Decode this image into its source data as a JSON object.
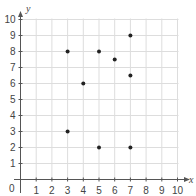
{
  "chart_data": {
    "type": "scatter",
    "title": "",
    "xlabel": "x",
    "ylabel": "y",
    "xlim": [
      0,
      10
    ],
    "ylim": [
      0,
      10
    ],
    "grid": true,
    "legend": null,
    "x_ticks": [
      "1",
      "2",
      "3",
      "4",
      "5",
      "6",
      "7",
      "8",
      "9",
      "10"
    ],
    "y_ticks": [
      "1",
      "2",
      "3",
      "4",
      "5",
      "6",
      "7",
      "8",
      "9",
      "10"
    ],
    "origin_label": "0",
    "points": [
      {
        "x": 3,
        "y": 8
      },
      {
        "x": 5,
        "y": 8
      },
      {
        "x": 7,
        "y": 9
      },
      {
        "x": 6,
        "y": 7.5
      },
      {
        "x": 4,
        "y": 6
      },
      {
        "x": 7,
        "y": 6.5
      },
      {
        "x": 3,
        "y": 3
      },
      {
        "x": 5,
        "y": 2
      },
      {
        "x": 7,
        "y": 2
      }
    ],
    "colors": {
      "grid": "#dddddd",
      "axis": "#555555",
      "point": "#222222",
      "text": "#444444"
    }
  }
}
